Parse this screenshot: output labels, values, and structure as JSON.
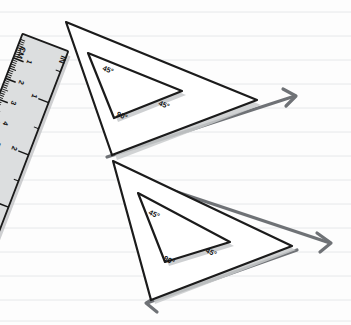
{
  "scene": {
    "title": "Set squares and ruler on ruled paper",
    "width": 351,
    "height": 325,
    "background_color": "#fdfdfd",
    "rule_line_color": "#e6e8ea",
    "rule_line_spacing": 24,
    "rule_line_count": 14
  },
  "ruler": {
    "name": "ruler",
    "fill_color": "#dcdedf",
    "outline_color": "#1b1b1b",
    "rotation_degrees": 21,
    "unit_labels": {
      "metric": "CM",
      "imperial": "IN"
    },
    "cm_ticks": [
      "1",
      "2",
      "3",
      "4",
      "5",
      "6",
      "7",
      "8",
      "9",
      "10",
      "11"
    ],
    "in_ticks": [
      "1",
      "2",
      "3",
      "4"
    ]
  },
  "triangles": [
    {
      "name": "upper-set-square",
      "angles": {
        "top": "45°",
        "bottom_left": "90°",
        "right": "45°"
      },
      "fill_color": "#ffffff",
      "outline_color": "#1b1b1b",
      "shadow_color": "#c9cbcd"
    },
    {
      "name": "lower-set-square",
      "angles": {
        "top": "45°",
        "bottom_left": "90°",
        "right": "45°"
      },
      "fill_color": "#ffffff",
      "outline_color": "#1b1b1b",
      "shadow_color": "#c9cbcd"
    }
  ],
  "arrows": {
    "color": "#6f7276",
    "items": [
      {
        "name": "upper-right-arrow",
        "direction": "right"
      },
      {
        "name": "lower-right-arrow",
        "direction": "right"
      },
      {
        "name": "lower-left-arrow",
        "direction": "left"
      }
    ]
  }
}
